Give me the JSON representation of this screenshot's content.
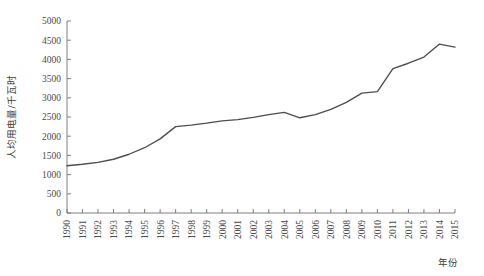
{
  "chart_data": {
    "type": "line",
    "title": "",
    "xlabel": "年份",
    "ylabel": "人均用电量/千瓦时",
    "grid": false,
    "legend": "none",
    "xlim": [
      1990,
      2015
    ],
    "ylim": [
      0,
      5000
    ],
    "ytick_labels": [
      "0",
      "500",
      "1000",
      "1500",
      "2000",
      "2500",
      "3000",
      "3500",
      "4000",
      "4500",
      "5000"
    ],
    "ytick_values": [
      0,
      500,
      1000,
      1500,
      2000,
      2500,
      3000,
      3500,
      4000,
      4500,
      5000
    ],
    "categories": [
      "1990",
      "1991",
      "1992",
      "1993",
      "1994",
      "1995",
      "1996",
      "1997",
      "1998",
      "1999",
      "2000",
      "2001",
      "2002",
      "2003",
      "2004",
      "2005",
      "2006",
      "2007",
      "2008",
      "2009",
      "2010",
      "2011",
      "2012",
      "2013",
      "2014",
      "2015"
    ],
    "x": [
      1990,
      1991,
      1992,
      1993,
      1994,
      1995,
      1996,
      1997,
      1998,
      1999,
      2000,
      2001,
      2002,
      2003,
      2004,
      2005,
      2006,
      2007,
      2008,
      2009,
      2010,
      2011,
      2012,
      2013,
      2014,
      2015
    ],
    "values": [
      1230,
      1270,
      1320,
      1400,
      1530,
      1700,
      1930,
      2250,
      2290,
      2340,
      2400,
      2430,
      2490,
      2560,
      2620,
      2480,
      2560,
      2700,
      2880,
      3120,
      3160,
      3760,
      3900,
      4060,
      4400,
      4320
    ],
    "series": [
      {
        "name": "人均用电量",
        "values": [
          1230,
          1270,
          1320,
          1400,
          1530,
          1700,
          1930,
          2250,
          2290,
          2340,
          2400,
          2430,
          2490,
          2560,
          2620,
          2480,
          2560,
          2700,
          2880,
          3120,
          3160,
          3760,
          3900,
          4060,
          4400,
          4320
        ],
        "color": "#4d4d4d"
      }
    ],
    "line_color": "#4d4d4d",
    "axis_color": "#6f6f6f",
    "tick_text_color": "#4a4a4a",
    "background": "#ffffff"
  }
}
